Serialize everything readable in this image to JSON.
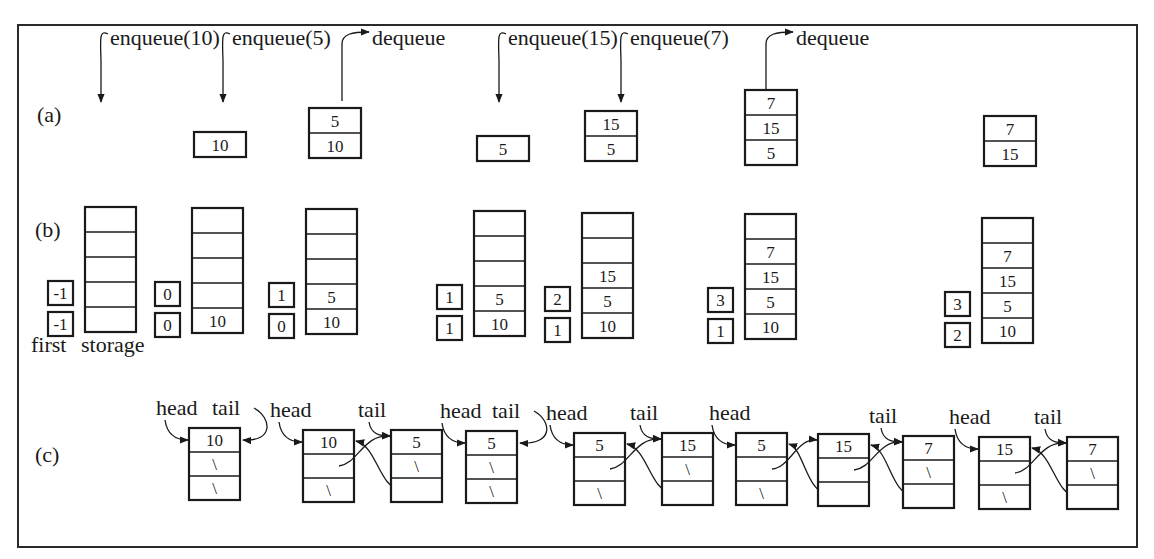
{
  "colors": {
    "ink": "#1a1a1a",
    "background": "#ffffff"
  },
  "panels": {
    "a": {
      "label": "(a)",
      "operations": [
        {
          "text": "enqueue(10)",
          "x": 110,
          "y": 20
        },
        {
          "text": "enqueue(5)",
          "x": 232,
          "y": 20
        },
        {
          "text": "dequeue",
          "x": 372,
          "y": 20
        },
        {
          "text": "enqueue(15)",
          "x": 508,
          "y": 20
        },
        {
          "text": "enqueue(7)",
          "x": 630,
          "y": 20
        },
        {
          "text": "dequeue",
          "x": 796,
          "y": 20
        }
      ],
      "queues": [
        {
          "x": 194,
          "y": 132,
          "cells": [
            "10"
          ]
        },
        {
          "x": 309,
          "y": 108,
          "cells": [
            "5",
            "10"
          ]
        },
        {
          "x": 477,
          "y": 136,
          "cells": [
            "5"
          ]
        },
        {
          "x": 585,
          "y": 111,
          "cells": [
            "15",
            "5"
          ]
        },
        {
          "x": 745,
          "y": 90,
          "cells": [
            "7",
            "15",
            "5"
          ]
        },
        {
          "x": 984,
          "y": 116,
          "cells": [
            "7",
            "15"
          ]
        }
      ]
    },
    "b": {
      "label": "(b)",
      "first_label": "first",
      "storage_label": "storage",
      "states": [
        {
          "x": 85,
          "y": 207,
          "last": "-1",
          "first": "-1",
          "cells": [
            "",
            "",
            "",
            "",
            ""
          ]
        },
        {
          "x": 192,
          "y": 208,
          "last": "0",
          "first": "0",
          "cells": [
            "",
            "",
            "",
            "",
            "10"
          ]
        },
        {
          "x": 306,
          "y": 209,
          "last": "1",
          "first": "0",
          "cells": [
            "",
            "",
            "",
            "5",
            "10"
          ]
        },
        {
          "x": 474,
          "y": 211,
          "last": "1",
          "first": "1",
          "cells": [
            "",
            "",
            "",
            "5",
            "10"
          ]
        },
        {
          "x": 582,
          "y": 213,
          "last": "2",
          "first": "1",
          "cells": [
            "",
            "",
            "15",
            "5",
            "10"
          ]
        },
        {
          "x": 745,
          "y": 214,
          "last": "3",
          "first": "1",
          "cells": [
            "",
            "7",
            "15",
            "5",
            "10"
          ]
        },
        {
          "x": 982,
          "y": 218,
          "last": "3",
          "first": "2",
          "cells": [
            "",
            "7",
            "15",
            "5",
            "10"
          ]
        }
      ]
    },
    "c": {
      "label": "(c)",
      "head_label": "head",
      "tail_label": "tail",
      "null_marker": "\\",
      "lists": [
        {
          "head_x": 156,
          "tail_x": 212,
          "nodes": [
            {
              "x": 189,
              "y": 428,
              "value": "10",
              "next": "\\",
              "prev": "\\"
            }
          ]
        },
        {
          "head_x": 270,
          "tail_x": 358,
          "nodes": [
            {
              "x": 303,
              "y": 430,
              "value": "10",
              "next": "",
              "prev": "\\"
            },
            {
              "x": 391,
              "y": 430,
              "value": "5",
              "next": "\\",
              "prev": ""
            }
          ]
        },
        {
          "head_x": 440,
          "tail_x": 492,
          "nodes": [
            {
              "x": 466,
              "y": 431,
              "value": "5",
              "next": "\\",
              "prev": "\\"
            }
          ]
        },
        {
          "head_x": 546,
          "tail_x": 630,
          "nodes": [
            {
              "x": 574,
              "y": 433,
              "value": "5",
              "next": "",
              "prev": "\\"
            },
            {
              "x": 662,
              "y": 433,
              "value": "15",
              "next": "\\",
              "prev": ""
            }
          ]
        },
        {
          "head_x": 709,
          "tail_x": 869,
          "nodes": [
            {
              "x": 736,
              "y": 433,
              "value": "5",
              "next": "",
              "prev": "\\"
            },
            {
              "x": 818,
              "y": 434,
              "value": "15",
              "next": "",
              "prev": ""
            },
            {
              "x": 903,
              "y": 436,
              "value": "7",
              "next": "\\",
              "prev": ""
            }
          ]
        },
        {
          "head_x": 949,
          "tail_x": 1034,
          "nodes": [
            {
              "x": 979,
              "y": 437,
              "value": "15",
              "next": "",
              "prev": "\\"
            },
            {
              "x": 1067,
              "y": 437,
              "value": "7",
              "next": "\\",
              "prev": ""
            }
          ]
        }
      ]
    }
  }
}
